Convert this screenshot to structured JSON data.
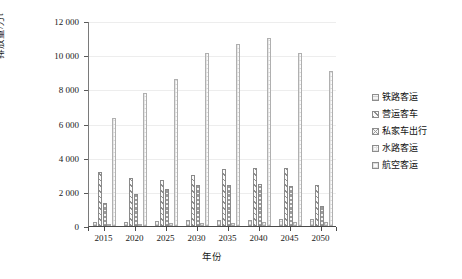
{
  "chart_data": {
    "type": "bar",
    "title": "",
    "xlabel": "年份",
    "ylabel": "排放量/万t",
    "categories": [
      "2015",
      "2020",
      "2025",
      "2030",
      "2035",
      "2040",
      "2045",
      "2050"
    ],
    "ylim": [
      0,
      12000
    ],
    "ytick_labels": [
      "0",
      "2 000",
      "4 000",
      "6 000",
      "8 000",
      "10 000",
      "12 000"
    ],
    "ytick_values": [
      0,
      2000,
      4000,
      6000,
      8000,
      10000,
      12000
    ],
    "grid": true,
    "legend_position": "right",
    "series": [
      {
        "name": "铁路客运",
        "pattern": "light-vertical-ticks",
        "values": [
          220,
          260,
          300,
          330,
          360,
          380,
          400,
          420
        ]
      },
      {
        "name": "营运客车",
        "pattern": "diagonal-hatch",
        "values": [
          3180,
          2820,
          2700,
          3000,
          3350,
          3400,
          3380,
          2400
        ]
      },
      {
        "name": "私家车出行",
        "pattern": "dense-crosshatch",
        "values": [
          1320,
          1880,
          2140,
          2400,
          2420,
          2460,
          2370,
          1150
        ]
      },
      {
        "name": "水路客运",
        "pattern": "light-speckle",
        "values": [
          120,
          140,
          160,
          180,
          200,
          210,
          215,
          220
        ]
      },
      {
        "name": "航空客运",
        "pattern": "light-dotted",
        "values": [
          6300,
          7800,
          8600,
          10100,
          10650,
          11000,
          10150,
          9100
        ]
      }
    ]
  }
}
